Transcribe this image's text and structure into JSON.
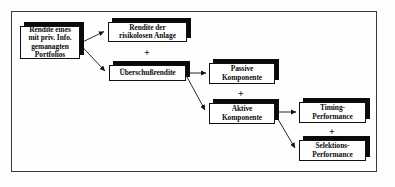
{
  "diagram": {
    "frame_color": "#3a3a3a",
    "background_color": "#fdfdfc",
    "box_fill_color": "#ffffff",
    "box_border_color": "#101010",
    "shadow_color": "#0b0b0b",
    "text_color": "#0c0c0c",
    "connector_color": "#111111",
    "nodes": [
      {
        "id": "portfolio-rendite",
        "label": "Rendite eines\nmit priv. Info.\ngemanagten\nPortfolios"
      },
      {
        "id": "risikolose-rendite",
        "label": "Rendite der\nrisikolosen Anlage"
      },
      {
        "id": "ueberschussrendite",
        "label": "Überschußrendite"
      },
      {
        "id": "passive-komponente",
        "label": "Passive\nKomponente"
      },
      {
        "id": "aktive-komponente",
        "label": "Aktive\nKomponente"
      },
      {
        "id": "timing-performance",
        "label": "Timing-\nPerformance"
      },
      {
        "id": "selektions-performance",
        "label": "Selektions-\nPerformance"
      }
    ],
    "operators": [
      {
        "id": "plus-1",
        "symbol": "+"
      },
      {
        "id": "plus-2",
        "symbol": "+"
      },
      {
        "id": "plus-3",
        "symbol": "+"
      }
    ],
    "edges": [
      {
        "from": "portfolio-rendite",
        "to": "risikolose-rendite"
      },
      {
        "from": "portfolio-rendite",
        "to": "ueberschussrendite"
      },
      {
        "from": "ueberschussrendite",
        "to": "passive-komponente"
      },
      {
        "from": "ueberschussrendite",
        "to": "aktive-komponente"
      },
      {
        "from": "aktive-komponente",
        "to": "timing-performance"
      },
      {
        "from": "aktive-komponente",
        "to": "selektions-performance"
      }
    ]
  }
}
